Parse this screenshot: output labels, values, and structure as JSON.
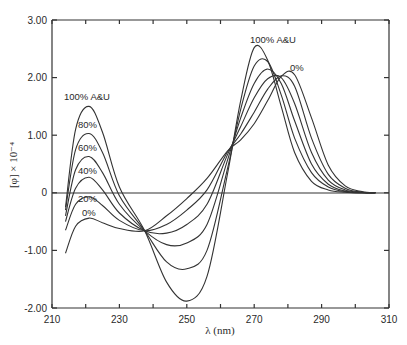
{
  "chart_data": {
    "type": "line",
    "title": "",
    "xlabel": "λ (nm)",
    "ylabel": "[φ] × 10⁻⁴",
    "xlim": [
      210,
      310
    ],
    "ylim": [
      -2.0,
      3.0
    ],
    "x_ticks": [
      210,
      220,
      230,
      240,
      250,
      260,
      270,
      280,
      290,
      300,
      310
    ],
    "x_tick_labels": [
      "210",
      "230",
      "250",
      "270",
      "290",
      "310"
    ],
    "y_ticks": [
      3.0,
      2.0,
      1.0,
      0,
      -1.0,
      -2.0
    ],
    "y_tick_labels": [
      "3.00",
      "2.00",
      "1.00",
      "0",
      "-1.00",
      "-2.00"
    ],
    "grid": false,
    "zero_line": true,
    "annotations": {
      "short_top": "100% A&U",
      "short_80": "80%",
      "short_60": "60%",
      "short_40": "40%",
      "short_20": "20%",
      "short_0": "0%",
      "long_top": "100% A&U",
      "long_0": "0%"
    },
    "x": [
      214,
      217,
      221,
      225,
      230,
      237.5,
      244,
      250,
      256,
      262,
      266,
      270,
      274,
      278,
      282,
      287,
      292,
      297,
      302,
      306
    ],
    "series": [
      {
        "name": "100% A&U",
        "values": [
          -0.25,
          1.1,
          1.5,
          1.05,
          0.1,
          -0.66,
          -1.55,
          -1.88,
          -1.45,
          0.3,
          1.6,
          2.52,
          2.3,
          1.5,
          0.7,
          0.2,
          0.05,
          0.01,
          0.0,
          0.0
        ]
      },
      {
        "name": "80%",
        "values": [
          -0.3,
          0.75,
          1.03,
          0.7,
          -0.05,
          -0.66,
          -1.2,
          -1.32,
          -1.0,
          0.4,
          1.45,
          2.2,
          2.28,
          1.7,
          0.95,
          0.35,
          0.1,
          0.02,
          0.0,
          0.0
        ]
      },
      {
        "name": "60%",
        "values": [
          -0.4,
          0.4,
          0.63,
          0.35,
          -0.2,
          -0.66,
          -0.9,
          -0.87,
          -0.55,
          0.55,
          1.3,
          1.9,
          2.15,
          1.9,
          1.25,
          0.5,
          0.15,
          0.03,
          0.0,
          0.0
        ]
      },
      {
        "name": "40%",
        "values": [
          -0.5,
          0.08,
          0.27,
          0.05,
          -0.35,
          -0.66,
          -0.7,
          -0.55,
          -0.2,
          0.65,
          1.15,
          1.65,
          1.98,
          2.0,
          1.55,
          0.7,
          0.22,
          0.05,
          0.01,
          0.0
        ]
      },
      {
        "name": "20%",
        "values": [
          -0.65,
          -0.2,
          -0.07,
          -0.22,
          -0.48,
          -0.66,
          -0.55,
          -0.3,
          0.05,
          0.7,
          1.02,
          1.4,
          1.8,
          2.03,
          1.85,
          0.95,
          0.32,
          0.08,
          0.01,
          0.0
        ]
      },
      {
        "name": "0%",
        "values": [
          -1.05,
          -0.58,
          -0.44,
          -0.52,
          -0.62,
          -0.66,
          -0.4,
          -0.1,
          0.25,
          0.72,
          0.92,
          1.2,
          1.6,
          2.02,
          2.05,
          1.3,
          0.48,
          0.12,
          0.02,
          0.0
        ]
      }
    ]
  }
}
